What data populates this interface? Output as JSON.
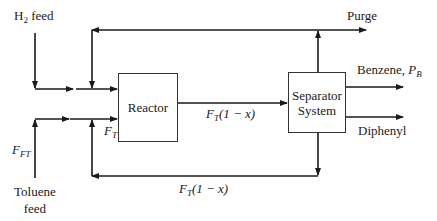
{
  "diagram": {
    "type": "process-flow",
    "blocks": {
      "reactor": {
        "label": "Reactor"
      },
      "separator": {
        "line1": "Separator",
        "line2": "System"
      }
    },
    "streams": {
      "h2_feed": {
        "main": "H",
        "sub": "2",
        "rest": " feed"
      },
      "toluene_feed": {
        "line1": "Toluene",
        "line2": "feed"
      },
      "toluene_flow": {
        "main": "F",
        "sub": "FT"
      },
      "reactor_feed": {
        "main": "F",
        "sub": "T"
      },
      "reactor_effluent": {
        "main": "F",
        "sub": "T",
        "rest": "(1 − x)"
      },
      "recycle": {
        "main": "F",
        "sub": "T",
        "rest": "(1 − x)"
      },
      "purge": {
        "label": "Purge"
      },
      "benzene": {
        "label": "Benzene, ",
        "main": "P",
        "sub": "B"
      },
      "diphenyl": {
        "label": "Diphenyl"
      }
    },
    "colors": {
      "line": "#1a1a1a",
      "box_border": "#333333",
      "background": "#ffffff"
    }
  }
}
